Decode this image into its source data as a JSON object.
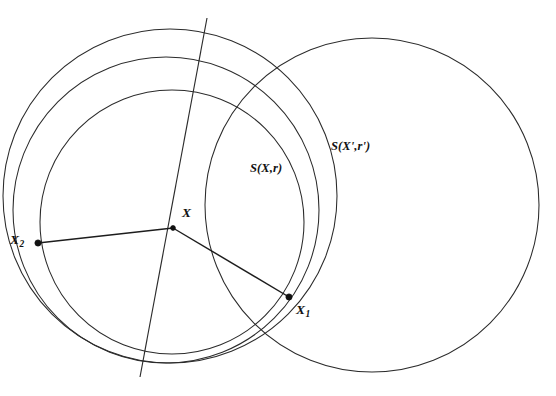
{
  "figure": {
    "name": "three-circles-geometry-diagram",
    "background_color": "#ffffff",
    "stroke_color": "#2b2b2b",
    "width": 556,
    "height": 396,
    "labels": {
      "center_point": "X",
      "point_1": "X",
      "point_1_sub": "1",
      "point_2": "X",
      "point_2_sub": "2",
      "sphere_small": "S(X,r)",
      "sphere_large": "S(X',r')"
    },
    "points": [
      {
        "name": "X",
        "x": 173,
        "y": 228
      },
      {
        "name": "X1",
        "x": 289,
        "y": 297
      },
      {
        "name": "X2",
        "x": 38,
        "y": 243
      }
    ],
    "circles": [
      {
        "name": "S(X,r)",
        "cx": 172,
        "cy": 222,
        "r": 132
      },
      {
        "name": "middle",
        "cx": 166,
        "cy": 210,
        "r": 153
      },
      {
        "name": "S(X',r')",
        "cx": 372,
        "cy": 205,
        "r": 167
      },
      {
        "name": "outer-left",
        "cx": 170,
        "cy": 196,
        "r": 167
      }
    ],
    "segments": [
      {
        "name": "radius-to-X2",
        "x1": 173,
        "y1": 228,
        "x2": 38,
        "y2": 243
      },
      {
        "name": "radius-to-X1",
        "x1": 173,
        "y1": 228,
        "x2": 289,
        "y2": 297
      },
      {
        "name": "oblique-line",
        "x1": 207,
        "y1": 18,
        "x2": 140,
        "y2": 377
      }
    ]
  }
}
